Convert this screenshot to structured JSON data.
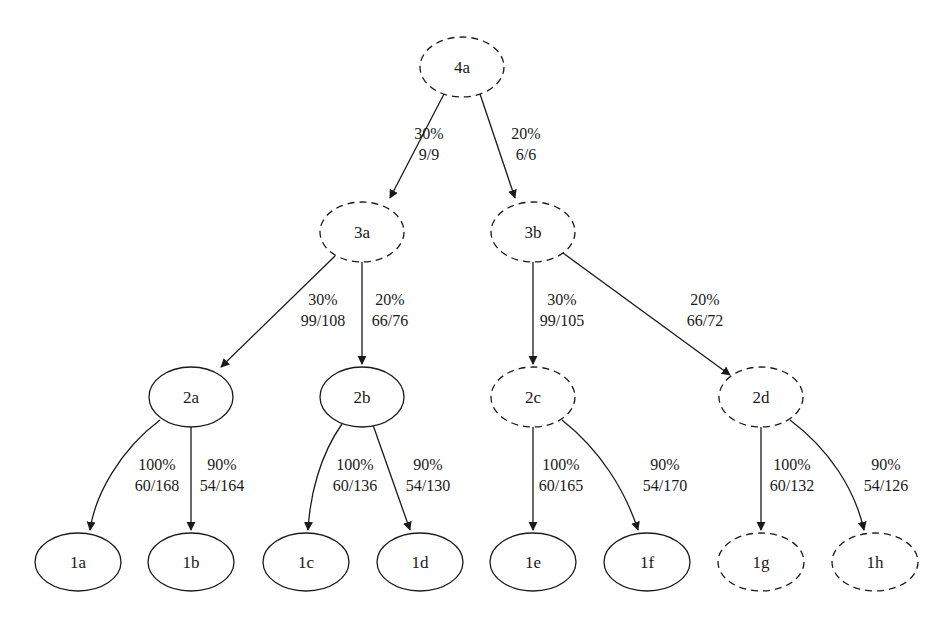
{
  "diagram": {
    "type": "tree",
    "colors": {
      "stroke": "#1a1a1a",
      "text": "#1a1a1a",
      "background": "#ffffff"
    },
    "nodes": [
      {
        "id": "4a",
        "label": "4a",
        "x": 462,
        "y": 67,
        "rx": 42,
        "ry": 30,
        "style": "dashed"
      },
      {
        "id": "3a",
        "label": "3a",
        "x": 362,
        "y": 232,
        "rx": 42,
        "ry": 30,
        "style": "dashed"
      },
      {
        "id": "3b",
        "label": "3b",
        "x": 533,
        "y": 232,
        "rx": 42,
        "ry": 30,
        "style": "dashed"
      },
      {
        "id": "2a",
        "label": "2a",
        "x": 191,
        "y": 397,
        "rx": 42,
        "ry": 30,
        "style": "solid"
      },
      {
        "id": "2b",
        "label": "2b",
        "x": 362,
        "y": 397,
        "rx": 42,
        "ry": 30,
        "style": "solid"
      },
      {
        "id": "2c",
        "label": "2c",
        "x": 533,
        "y": 397,
        "rx": 42,
        "ry": 30,
        "style": "dashed"
      },
      {
        "id": "2d",
        "label": "2d",
        "x": 761,
        "y": 397,
        "rx": 42,
        "ry": 30,
        "style": "dashed"
      },
      {
        "id": "1a",
        "label": "1a",
        "x": 78,
        "y": 562,
        "rx": 43,
        "ry": 29,
        "style": "solid"
      },
      {
        "id": "1b",
        "label": "1b",
        "x": 191,
        "y": 562,
        "rx": 43,
        "ry": 29,
        "style": "solid"
      },
      {
        "id": "1c",
        "label": "1c",
        "x": 306,
        "y": 562,
        "rx": 43,
        "ry": 29,
        "style": "solid"
      },
      {
        "id": "1d",
        "label": "1d",
        "x": 420,
        "y": 562,
        "rx": 43,
        "ry": 29,
        "style": "solid"
      },
      {
        "id": "1e",
        "label": "1e",
        "x": 533,
        "y": 562,
        "rx": 43,
        "ry": 29,
        "style": "solid"
      },
      {
        "id": "1f",
        "label": "1f",
        "x": 647,
        "y": 562,
        "rx": 43,
        "ry": 29,
        "style": "solid"
      },
      {
        "id": "1g",
        "label": "1g",
        "x": 761,
        "y": 562,
        "rx": 43,
        "ry": 29,
        "style": "dashed"
      },
      {
        "id": "1h",
        "label": "1h",
        "x": 875,
        "y": 562,
        "rx": 43,
        "ry": 29,
        "style": "dashed"
      }
    ],
    "edges": [
      {
        "from": "4a",
        "to": "3a",
        "percent": "30%",
        "ratio": "9/9",
        "d": "M 444 94 L 390 198",
        "lx": 429,
        "ly": 139
      },
      {
        "from": "4a",
        "to": "3b",
        "percent": "20%",
        "ratio": "6/6",
        "d": "M 480 94 L 515 198",
        "lx": 526,
        "ly": 139
      },
      {
        "from": "3a",
        "to": "2a",
        "percent": "30%",
        "ratio": "99/108",
        "d": "M 335 256 L 221 367",
        "lx": 323,
        "ly": 305
      },
      {
        "from": "3a",
        "to": "2b",
        "percent": "20%",
        "ratio": "66/76",
        "d": "M 362 262 L 362 364",
        "lx": 390,
        "ly": 305
      },
      {
        "from": "3b",
        "to": "2c",
        "percent": "30%",
        "ratio": "99/105",
        "d": "M 533 262 L 533 364",
        "lx": 562,
        "ly": 305
      },
      {
        "from": "3b",
        "to": "2d",
        "percent": "20%",
        "ratio": "66/72",
        "d": "M 563 253 L 730 375",
        "lx": 705,
        "ly": 305
      },
      {
        "from": "2a",
        "to": "1a",
        "percent": "100%",
        "ratio": "60/168",
        "d": "M 160 420 C 120 450, 95 495, 90 530",
        "lx": 157,
        "ly": 470
      },
      {
        "from": "2a",
        "to": "1b",
        "percent": "90%",
        "ratio": "54/164",
        "d": "M 191 427 L 191 530",
        "lx": 222,
        "ly": 470
      },
      {
        "from": "2b",
        "to": "1c",
        "percent": "100%",
        "ratio": "60/136",
        "d": "M 342 424 C 320 455, 310 495, 308 530",
        "lx": 355,
        "ly": 470
      },
      {
        "from": "2b",
        "to": "1d",
        "percent": "90%",
        "ratio": "54/130",
        "d": "M 373 425 L 410 530",
        "lx": 428,
        "ly": 470
      },
      {
        "from": "2c",
        "to": "1e",
        "percent": "100%",
        "ratio": "60/165",
        "d": "M 533 427 L 533 530",
        "lx": 561,
        "ly": 470
      },
      {
        "from": "2c",
        "to": "1f",
        "percent": "90%",
        "ratio": "54/170",
        "d": "M 562 420 C 600 450, 625 490, 638 530",
        "lx": 665,
        "ly": 470
      },
      {
        "from": "2d",
        "to": "1g",
        "percent": "100%",
        "ratio": "60/132",
        "d": "M 761 427 L 761 530",
        "lx": 792,
        "ly": 470
      },
      {
        "from": "2d",
        "to": "1h",
        "percent": "90%",
        "ratio": "54/126",
        "d": "M 790 420 C 830 450, 855 490, 864 530",
        "lx": 886,
        "ly": 470
      }
    ]
  }
}
